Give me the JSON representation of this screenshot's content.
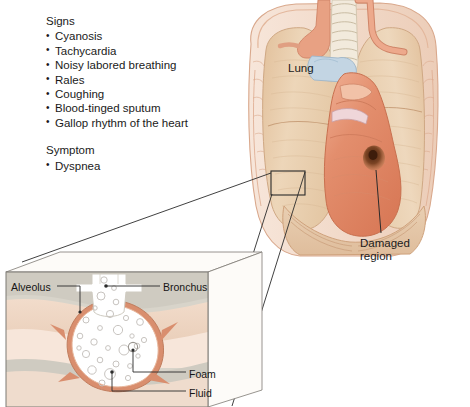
{
  "figure": {
    "signs": {
      "heading": "Signs",
      "items": [
        "Cyanosis",
        "Tachycardia",
        "Noisy labored breathing",
        "Rales",
        "Coughing",
        "Blood-tinged sputum",
        "Gallop rhythm of the heart"
      ]
    },
    "symptom": {
      "heading": "Symptom",
      "items": [
        "Dyspnea"
      ]
    },
    "anatomy_labels": {
      "lung": "Lung",
      "damaged_region_line1": "Damaged",
      "damaged_region_line2": "region"
    },
    "inset_labels": {
      "alveolus": "Alveolus",
      "bronchus": "Bronchus",
      "foam": "Foam",
      "fluid": "Fluid"
    },
    "colors": {
      "lung_tissue": "#e7c9a6",
      "lung_tissue_light": "#f0dcc2",
      "ribcage": "#f3ded0",
      "rib_outline": "#d9a88c",
      "heart": "#e08a6a",
      "heart_light": "#eda78a",
      "damaged_spot": "#5d2e16",
      "trachea": "#efe6d8",
      "vessel_pink": "#e39b86",
      "vessel_blue": "#bcd0e0",
      "inset_bg": "#d6d2c8",
      "inset_tissue": "#f0d9c6",
      "inset_tissue_pink": "#f6e3d7",
      "alveolus_fill": "#ffffff",
      "alveolus_wall": "#d98e6e",
      "bubble_stroke": "#c8c4c0",
      "leader_line": "#2b2b2b",
      "text": "#1a1a1a"
    }
  }
}
